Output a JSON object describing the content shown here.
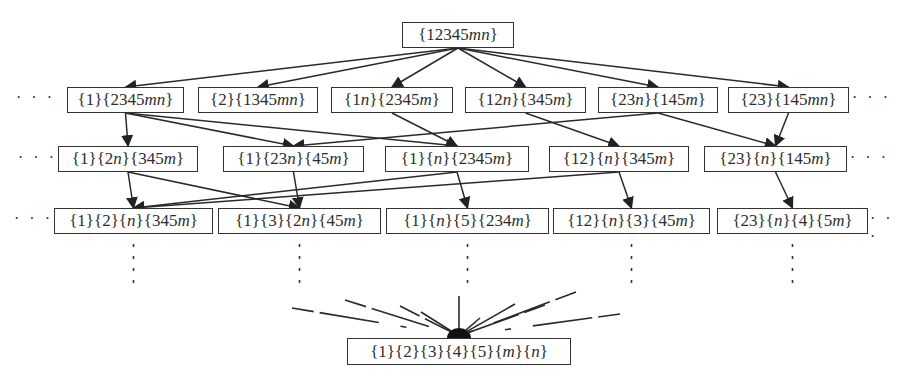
{
  "diagram": {
    "type": "partition lattice / hierarchy",
    "top": {
      "id": "t",
      "label": "{12345mn}"
    },
    "rows": [
      [
        {
          "id": "r1a",
          "label": "{1}{2345mn}"
        },
        {
          "id": "r1b",
          "label": "{2}{1345mn}"
        },
        {
          "id": "r1c",
          "label": "{1n}{2345m}"
        },
        {
          "id": "r1d",
          "label": "{12n}{345m}"
        },
        {
          "id": "r1e",
          "label": "{23n}{145m}"
        },
        {
          "id": "r1f",
          "label": "{23}{145mn}"
        }
      ],
      [
        {
          "id": "r2a",
          "label": "{1}{2n}{345m}"
        },
        {
          "id": "r2b",
          "label": "{1}{23n}{45m}"
        },
        {
          "id": "r2c",
          "label": "{1}{n}{2345m}"
        },
        {
          "id": "r2d",
          "label": "{12}{n}{345m}"
        },
        {
          "id": "r2e",
          "label": "{23}{n}{145m}"
        }
      ],
      [
        {
          "id": "r3a",
          "label": "{1}{2}{n}{345m}"
        },
        {
          "id": "r3b",
          "label": "{1}{3}{2n}{45m}"
        },
        {
          "id": "r3c",
          "label": "{1}{n}{5}{234m}"
        },
        {
          "id": "r3d",
          "label": "{12}{n}{3}{45m}"
        },
        {
          "id": "r3e",
          "label": "{23}{n}{4}{5m}"
        }
      ]
    ],
    "bottom": {
      "id": "b",
      "label": "{1}{2}{3}{4}{5}{m}{n}"
    },
    "ellipsis": "· · ·",
    "edges": [
      [
        "t",
        "r1a"
      ],
      [
        "t",
        "r1b"
      ],
      [
        "t",
        "r1c"
      ],
      [
        "t",
        "r1d"
      ],
      [
        "t",
        "r1e"
      ],
      [
        "t",
        "r1f"
      ],
      [
        "r1a",
        "r2a"
      ],
      [
        "r1a",
        "r2b"
      ],
      [
        "r1a",
        "r2c"
      ],
      [
        "r1c",
        "r2c"
      ],
      [
        "r1d",
        "r2d"
      ],
      [
        "r1e",
        "r2b"
      ],
      [
        "r1e",
        "r2e"
      ],
      [
        "r1f",
        "r2e"
      ],
      [
        "r2a",
        "r3a"
      ],
      [
        "r2a",
        "r3b"
      ],
      [
        "r2b",
        "r3b"
      ],
      [
        "r2c",
        "r3a"
      ],
      [
        "r2c",
        "r3c"
      ],
      [
        "r2d",
        "r3a"
      ],
      [
        "r2d",
        "r3d"
      ],
      [
        "r2e",
        "r3e"
      ]
    ]
  }
}
